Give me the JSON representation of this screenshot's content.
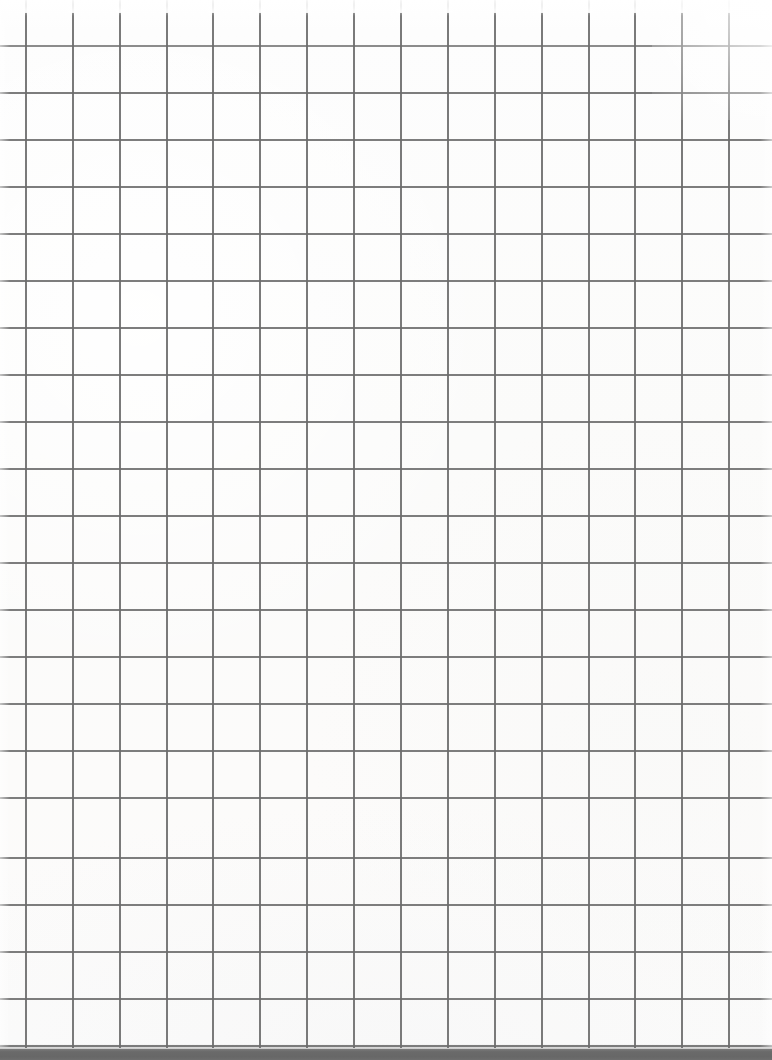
{
  "document": {
    "kind": "grid-paper-scan",
    "title": "Blank grid paper",
    "text_content": "",
    "annotations": []
  },
  "canvas": {
    "width": 772,
    "height": 1060
  },
  "paper": {
    "background_color": "#fcfcfc",
    "highlight_color": "#ffffff"
  },
  "grid": {
    "line_color": "#6b6b6b",
    "line_width": 2,
    "cell_size": 47,
    "vertical_line_count": 16,
    "horizontal_line_count": 22,
    "first_vertical_x": 25,
    "first_horizontal_y": 45,
    "vertical_x_positions": [
      25,
      72,
      119,
      166,
      212,
      259,
      306,
      353,
      400,
      447,
      494,
      541,
      588,
      634,
      681,
      728
    ],
    "horizontal_y_positions": [
      45,
      92,
      139,
      186,
      233,
      280,
      327,
      374,
      421,
      468,
      515,
      562,
      609,
      656,
      703,
      750,
      797,
      857,
      904,
      951,
      998,
      1045
    ],
    "vertical_line_height": 1048,
    "horizontal_line_width": 772
  },
  "bottom_bar": {
    "color": "#6a6a6a",
    "top_y": 1049,
    "height": 11
  },
  "top_bloom": {
    "y": 0,
    "height": 13
  }
}
